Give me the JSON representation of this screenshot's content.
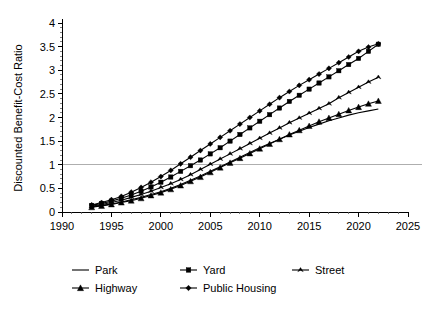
{
  "chart_data": {
    "type": "line",
    "title": "",
    "xlabel": "",
    "ylabel": "Discounted Benefit-Cost Ratio",
    "xlim": [
      1990,
      2025
    ],
    "ylim": [
      0,
      4
    ],
    "x_ticks": [
      1990,
      1995,
      2000,
      2005,
      2010,
      2015,
      2020,
      2025
    ],
    "x_tick_labels": [
      "1990",
      "1995",
      "2000",
      "2005",
      "2010",
      "2015",
      "2020",
      "2025"
    ],
    "x_minor_step": 1,
    "y_ticks": [
      0,
      0.5,
      1,
      1.5,
      2,
      2.5,
      3,
      3.5,
      4
    ],
    "y_tick_labels": [
      "0",
      "0.5",
      "1",
      "1.5",
      "2",
      "2.5",
      "3",
      "3.5",
      "4"
    ],
    "y_minor_step": 0.1,
    "grid": "horizontal-reference-at-1",
    "reference_line_y": 1,
    "legend_position": "bottom",
    "x": [
      1993,
      1994,
      1995,
      1996,
      1997,
      1998,
      1999,
      2000,
      2001,
      2002,
      2003,
      2004,
      2005,
      2006,
      2007,
      2008,
      2009,
      2010,
      2011,
      2012,
      2013,
      2014,
      2015,
      2016,
      2017,
      2018,
      2019,
      2020,
      2021,
      2022
    ],
    "series": [
      {
        "name": "Park",
        "marker": "none",
        "values": [
          0.11,
          0.14,
          0.17,
          0.21,
          0.26,
          0.31,
          0.37,
          0.43,
          0.5,
          0.58,
          0.67,
          0.76,
          0.86,
          0.96,
          1.06,
          1.16,
          1.26,
          1.36,
          1.45,
          1.54,
          1.63,
          1.71,
          1.79,
          1.86,
          1.93,
          1.99,
          2.05,
          2.1,
          2.14,
          2.18
        ]
      },
      {
        "name": "Yard",
        "marker": "square",
        "values": [
          0.14,
          0.18,
          0.23,
          0.29,
          0.36,
          0.44,
          0.53,
          0.63,
          0.74,
          0.86,
          0.98,
          1.1,
          1.23,
          1.36,
          1.5,
          1.64,
          1.78,
          1.92,
          2.06,
          2.2,
          2.34,
          2.47,
          2.6,
          2.73,
          2.86,
          2.99,
          3.12,
          3.25,
          3.4,
          3.55
        ]
      },
      {
        "name": "Street",
        "marker": "tick",
        "values": [
          0.12,
          0.16,
          0.2,
          0.25,
          0.31,
          0.37,
          0.44,
          0.52,
          0.6,
          0.69,
          0.79,
          0.9,
          1.01,
          1.12,
          1.23,
          1.34,
          1.45,
          1.56,
          1.67,
          1.78,
          1.89,
          1.99,
          2.09,
          2.19,
          2.29,
          2.42,
          2.53,
          2.64,
          2.75,
          2.85
        ]
      },
      {
        "name": "Highway",
        "marker": "triangle",
        "values": [
          0.1,
          0.13,
          0.16,
          0.2,
          0.24,
          0.29,
          0.35,
          0.41,
          0.48,
          0.56,
          0.65,
          0.74,
          0.84,
          0.94,
          1.04,
          1.14,
          1.24,
          1.34,
          1.44,
          1.54,
          1.64,
          1.73,
          1.82,
          1.91,
          1.99,
          2.07,
          2.15,
          2.22,
          2.29,
          2.35
        ]
      },
      {
        "name": "Public Housing",
        "marker": "diamond",
        "values": [
          0.15,
          0.2,
          0.26,
          0.33,
          0.42,
          0.52,
          0.63,
          0.75,
          0.88,
          1.02,
          1.16,
          1.3,
          1.44,
          1.58,
          1.72,
          1.86,
          2.0,
          2.14,
          2.28,
          2.42,
          2.55,
          2.68,
          2.8,
          2.92,
          3.04,
          3.16,
          3.28,
          3.4,
          3.49,
          3.56
        ]
      }
    ]
  },
  "legend": {
    "entries": [
      {
        "label": "Park",
        "marker": "none"
      },
      {
        "label": "Yard",
        "marker": "square"
      },
      {
        "label": "Street",
        "marker": "tick"
      },
      {
        "label": "Highway",
        "marker": "triangle"
      },
      {
        "label": "Public Housing",
        "marker": "diamond"
      }
    ]
  },
  "colors": {
    "series": "#000000",
    "axis": "#000000",
    "gridline": "#9a9a9a",
    "background": "#ffffff"
  }
}
